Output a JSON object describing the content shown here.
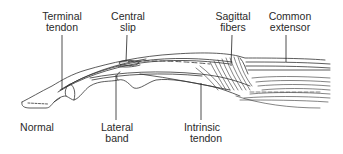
{
  "diagram": {
    "state_label": "Normal",
    "labels": {
      "terminal_tendon": {
        "line1": "Terminal",
        "line2": "tendon"
      },
      "central_slip": {
        "line1": "Central",
        "line2": "slip"
      },
      "sagittal_fibers": {
        "line1": "Sagittal",
        "line2": "fibers"
      },
      "common_extensor": {
        "line1": "Common",
        "line2": "extensor"
      },
      "lateral_band": {
        "line1": "Lateral",
        "line2": "band"
      },
      "intrinsic_tendon": {
        "line1": "Intrinsic",
        "line2": "tendon"
      }
    },
    "colors": {
      "ink": "#2a2a2a",
      "background": "#ffffff"
    }
  }
}
